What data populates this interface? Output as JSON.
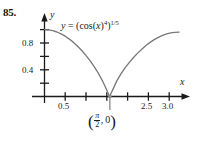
{
  "problem": {
    "number": "85."
  },
  "axes": {
    "x_name": "x",
    "y_name": "y"
  },
  "labels": {
    "equation_prefix": "y",
    "equation_equals": "=",
    "equation_open": "(cos(",
    "equation_var": "x",
    "equation_close": ")",
    "equation_inner_exp": "4",
    "equation_group_close": ")",
    "equation_outer_exp": "1/5",
    "equation_plain": "y = (cos(x)^4)^(1/5)",
    "point_open": "(",
    "point_num": "π",
    "point_den": "2",
    "point_comma": ", 0",
    "point_close": ")",
    "point_plain": "(π/2, 0)"
  },
  "colors": {
    "axis": "#1a1a1a",
    "curve": "#7a7a7a",
    "text": "#1a1a1a",
    "background": "#ffffff"
  },
  "chart_data": {
    "type": "line",
    "title": "",
    "xlabel": "x",
    "ylabel": "y",
    "equation": "y = (cos(x)^4)^(1/5)",
    "xlim": [
      0,
      3.35
    ],
    "ylim": [
      0,
      1.05
    ],
    "grid": false,
    "legend": false,
    "x_ticks_major": [
      0.5,
      2.5,
      3.0
    ],
    "x_ticks_minor": [
      1.0,
      1.5,
      2.0
    ],
    "x_tick_labels": [
      "0.5",
      "2.5",
      "3.0"
    ],
    "y_ticks_major": [
      0.4,
      0.8
    ],
    "y_ticks_minor": [
      0.2,
      0.6,
      1.0
    ],
    "y_tick_labels": [
      "0.4",
      "0.8"
    ],
    "annotations": [
      {
        "label": "(π/2, 0)",
        "x": 1.5707963,
        "y": 0,
        "note": "cusp touching x-axis"
      }
    ],
    "series": [
      {
        "name": "y = (cos(x)^4)^(1/5)",
        "x": [
          0.0,
          0.1,
          0.2,
          0.3,
          0.4,
          0.5,
          0.6,
          0.7,
          0.8,
          0.9,
          1.0,
          1.1,
          1.2,
          1.3,
          1.4,
          1.5,
          1.5707963,
          1.65,
          1.75,
          1.85,
          1.95,
          2.05,
          2.15,
          2.25,
          2.35,
          2.45,
          2.55,
          2.65,
          2.75,
          2.85,
          2.95,
          3.05,
          3.15,
          3.25
        ],
        "values": [
          1.0,
          0.996,
          0.9841,
          0.9642,
          0.9365,
          0.9012,
          0.8585,
          0.8086,
          0.7516,
          0.6873,
          0.6155,
          0.5357,
          0.4469,
          0.3476,
          0.2344,
          0.0995,
          0.0,
          0.1022,
          0.2376,
          0.3417,
          0.4309,
          0.5106,
          0.5828,
          0.6484,
          0.7079,
          0.7614,
          0.8088,
          0.8501,
          0.885,
          0.9134,
          0.9351,
          0.9504,
          0.9594,
          0.9631
        ]
      }
    ]
  }
}
